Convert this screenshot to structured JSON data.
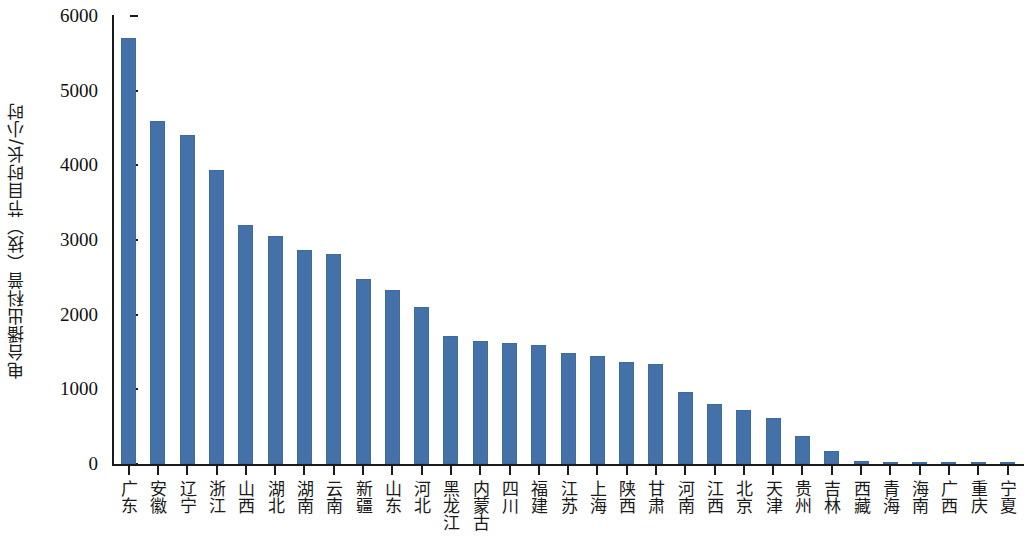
{
  "chart_data": {
    "type": "bar",
    "title": "",
    "xlabel": "",
    "ylabel": "电台播出科普（技）节目时长/小时",
    "ylim": [
      0,
      6000
    ],
    "ytick_labels": [
      "6000",
      "5000",
      "4000",
      "3000",
      "2000",
      "1000",
      "0"
    ],
    "yticks": [
      6000,
      5000,
      4000,
      3000,
      2000,
      1000,
      0
    ],
    "grid": false,
    "legend": false,
    "bar_color": "#4472a8",
    "axis_color": "#1a1a1a",
    "categories": [
      "广东",
      "安徽",
      "辽宁",
      "浙江",
      "山西",
      "湖北",
      "湖南",
      "云南",
      "新疆",
      "山东",
      "河北",
      "黑龙江",
      "内蒙古",
      "四川",
      "福建",
      "江苏",
      "上海",
      "陕西",
      "甘肃",
      "河南",
      "江西",
      "北京",
      "天津",
      "贵州",
      "吉林",
      "西藏",
      "青海",
      "海南",
      "广西",
      "重庆",
      "宁夏"
    ],
    "values": [
      5700,
      4600,
      4400,
      3940,
      3200,
      3060,
      2860,
      2810,
      2480,
      2330,
      2100,
      1720,
      1650,
      1620,
      1600,
      1490,
      1440,
      1360,
      1345,
      960,
      810,
      720,
      610,
      380,
      180,
      45,
      8,
      5,
      3,
      3,
      2
    ]
  }
}
